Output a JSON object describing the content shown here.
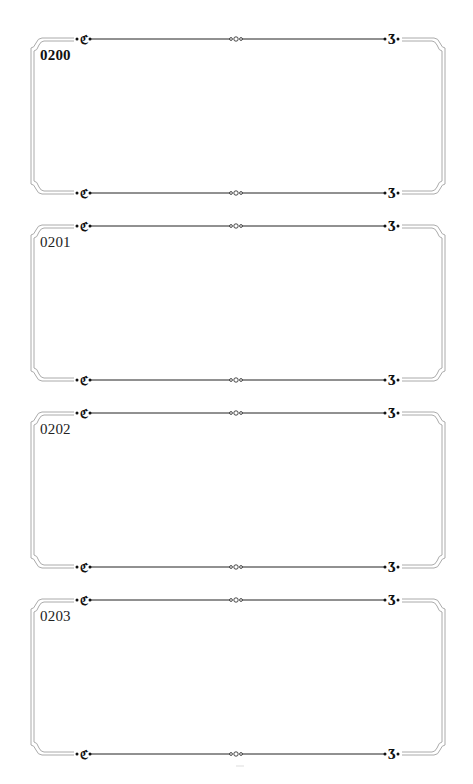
{
  "page": {
    "background": "#ffffff",
    "frame_color": "#999999",
    "rule_color": "#222222"
  },
  "cards": [
    {
      "label": "0200",
      "bold": true
    },
    {
      "label": "0201",
      "bold": false
    },
    {
      "label": "0202",
      "bold": false
    },
    {
      "label": "0203",
      "bold": false
    }
  ]
}
